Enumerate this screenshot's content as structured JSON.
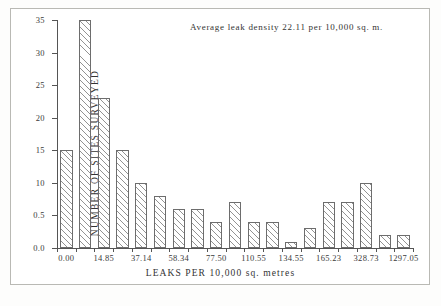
{
  "chart_data": {
    "type": "bar",
    "title": "",
    "annotation": "Average leak density 22.11 per 10,000 sq. m.",
    "xlabel": "LEAKS PER 10,000 sq. metres",
    "ylabel": "NUMBER OF SITES SURVEYED",
    "ylim": [
      0,
      35
    ],
    "yticks": [
      0,
      5,
      10,
      15,
      20,
      25,
      30,
      35
    ],
    "ytick_labels": [
      "0.0",
      "0.5",
      "10",
      "15",
      "20",
      "25",
      "30",
      "35"
    ],
    "grid": false,
    "legend": null,
    "bar_count": 19,
    "categories": [
      "0.00",
      "",
      "14.85",
      "",
      "37.14",
      "",
      "58.34",
      "",
      "77.50",
      "",
      "110.55",
      "",
      "134.55",
      "",
      "165.23",
      "",
      "328.73",
      "",
      "1297.05"
    ],
    "xtick_labels": [
      "0.00",
      "14.85",
      "37.14",
      "58.34",
      "77.50",
      "110.55",
      "134.55",
      "165.23",
      "328.73",
      "1297.05"
    ],
    "xtick_bar_index": [
      0,
      2,
      4,
      6,
      8,
      10,
      12,
      14,
      16,
      18
    ],
    "values": [
      15,
      35,
      23,
      15,
      10,
      8,
      6,
      6,
      4,
      7,
      4,
      4,
      1,
      3,
      7,
      7,
      10,
      2,
      2
    ],
    "bar_fill": "hatched-diagonal",
    "bar_edge_color": "#6d6d6d",
    "axis_color": "#555555",
    "background_color": "#ffffff"
  },
  "figure": {
    "frame_border_color": "#b9b9b4"
  }
}
